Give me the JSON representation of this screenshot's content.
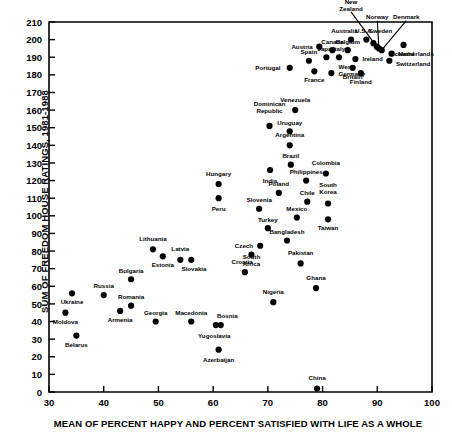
{
  "chart_data": {
    "type": "scatter",
    "title": "",
    "xlabel": "MEAN OF PERCENT HAPPY AND PERCENT SATISFIED WITH LIFE AS A WHOLE",
    "ylabel": "SUM OF FREEDOM HOUSE RATINGS, 1981-1988",
    "xlim": [
      30,
      100
    ],
    "ylim": [
      0,
      210
    ],
    "xticks": [
      30,
      40,
      50,
      60,
      70,
      80,
      90,
      100
    ],
    "yticks": [
      0,
      10,
      20,
      30,
      40,
      50,
      60,
      70,
      80,
      90,
      100,
      110,
      120,
      130,
      140,
      150,
      160,
      170,
      180,
      190,
      200,
      210
    ],
    "grid": false,
    "legend": null,
    "marker": "filled-circle",
    "points": [
      {
        "label": "Moldova",
        "x": 33.0,
        "y": 45,
        "lx": 33.0,
        "ly": 40,
        "anchor": "middle",
        "lead": false
      },
      {
        "label": "Ukraine",
        "x": 34.2,
        "y": 56,
        "lx": 34.2,
        "ly": 51,
        "anchor": "middle",
        "lead": false
      },
      {
        "label": "Belarus",
        "x": 35.0,
        "y": 32,
        "lx": 35.0,
        "ly": 27,
        "anchor": "middle",
        "lead": false
      },
      {
        "label": "Russia",
        "x": 40.0,
        "y": 55,
        "lx": 40.0,
        "ly": 60,
        "anchor": "middle",
        "lead": false
      },
      {
        "label": "Armenia",
        "x": 43.0,
        "y": 46,
        "lx": 43.0,
        "ly": 41,
        "anchor": "middle",
        "lead": false
      },
      {
        "label": "Bulgaria",
        "x": 45.0,
        "y": 64,
        "lx": 45.0,
        "ly": 69,
        "anchor": "middle",
        "lead": false
      },
      {
        "label": "Romania",
        "x": 45.0,
        "y": 49,
        "lx": 45.0,
        "ly": 54,
        "anchor": "middle",
        "lead": false
      },
      {
        "label": "Lithuania",
        "x": 49.0,
        "y": 81,
        "lx": 49.0,
        "ly": 87,
        "anchor": "middle",
        "lead": false
      },
      {
        "label": "Georgia",
        "x": 49.5,
        "y": 40,
        "lx": 49.5,
        "ly": 45,
        "anchor": "middle",
        "lead": false
      },
      {
        "label": "Estonia",
        "x": 50.8,
        "y": 77,
        "lx": 50.8,
        "ly": 72,
        "anchor": "middle",
        "lead": false
      },
      {
        "label": "Latvia",
        "x": 54.0,
        "y": 75,
        "lx": 54.0,
        "ly": 81,
        "anchor": "middle",
        "lead": false
      },
      {
        "label": "Macedonia",
        "x": 56.0,
        "y": 40,
        "lx": 56.0,
        "ly": 45,
        "anchor": "middle",
        "lead": false
      },
      {
        "label": "Slovakia",
        "x": 56.0,
        "y": 75,
        "lx": 56.5,
        "ly": 70,
        "anchor": "middle",
        "lead": false
      },
      {
        "label": "Bosnia",
        "x": 61.4,
        "y": 38,
        "lx": 62.6,
        "ly": 43,
        "anchor": "middle",
        "lead": false
      },
      {
        "label": "Yugoslavia",
        "x": 60.5,
        "y": 38,
        "lx": 60.2,
        "ly": 32,
        "anchor": "middle",
        "lead": false
      },
      {
        "label": "Azerbaijan",
        "x": 61.0,
        "y": 24,
        "lx": 61.0,
        "ly": 18,
        "anchor": "middle",
        "lead": false
      },
      {
        "label": "Hungary",
        "x": 61.0,
        "y": 118,
        "lx": 61.0,
        "ly": 124,
        "anchor": "middle",
        "lead": false
      },
      {
        "label": "Peru",
        "x": 61.0,
        "y": 110,
        "lx": 61.0,
        "ly": 104,
        "anchor": "middle",
        "lead": false
      },
      {
        "label": "Croatia",
        "x": 65.8,
        "y": 68,
        "lx": 65.3,
        "ly": 74,
        "anchor": "middle",
        "lead": false
      },
      {
        "label": "South Africa",
        "x": 67.0,
        "y": 78,
        "lx": 67.0,
        "ly": 73,
        "anchor": "middle",
        "lead": false,
        "two": true
      },
      {
        "label": "Czech",
        "x": 68.6,
        "y": 83,
        "lx": 67.3,
        "ly": 83,
        "anchor": "end",
        "lead": false
      },
      {
        "label": "Slovenia",
        "x": 68.4,
        "y": 104,
        "lx": 68.4,
        "ly": 109,
        "anchor": "middle",
        "lead": false
      },
      {
        "label": "Turkey",
        "x": 70.0,
        "y": 93,
        "lx": 70.0,
        "ly": 98,
        "anchor": "middle",
        "lead": false
      },
      {
        "label": "Dominican Republic",
        "x": 70.3,
        "y": 151,
        "lx": 70.3,
        "ly": 160,
        "anchor": "middle",
        "lead": false,
        "two": true
      },
      {
        "label": "India",
        "x": 70.4,
        "y": 126,
        "lx": 70.4,
        "ly": 120,
        "anchor": "middle",
        "lead": false
      },
      {
        "label": "Nigeria",
        "x": 71.0,
        "y": 51,
        "lx": 71.0,
        "ly": 57,
        "anchor": "middle",
        "lead": false
      },
      {
        "label": "Poland",
        "x": 72.0,
        "y": 113,
        "lx": 72.0,
        "ly": 118,
        "anchor": "middle",
        "lead": false
      },
      {
        "label": "Uruguay",
        "x": 74.0,
        "y": 148,
        "lx": 74.0,
        "ly": 153,
        "anchor": "middle",
        "lead": false
      },
      {
        "label": "Argentina",
        "x": 74.0,
        "y": 140,
        "lx": 74.0,
        "ly": 146,
        "anchor": "middle",
        "lead": false
      },
      {
        "label": "Brazil",
        "x": 74.2,
        "y": 129,
        "lx": 74.2,
        "ly": 134,
        "anchor": "middle",
        "lead": false
      },
      {
        "label": "Bangladesh",
        "x": 73.5,
        "y": 86,
        "lx": 73.5,
        "ly": 91,
        "anchor": "middle",
        "lead": false
      },
      {
        "label": "Venezuela",
        "x": 75.0,
        "y": 160,
        "lx": 75.0,
        "ly": 166,
        "anchor": "middle",
        "lead": false
      },
      {
        "label": "Mexico",
        "x": 75.3,
        "y": 99,
        "lx": 75.3,
        "ly": 104,
        "anchor": "middle",
        "lead": false
      },
      {
        "label": "Pakistan",
        "x": 76.0,
        "y": 73,
        "lx": 76.0,
        "ly": 79,
        "anchor": "middle",
        "lead": false
      },
      {
        "label": "Philippines",
        "x": 77.0,
        "y": 120,
        "lx": 77.0,
        "ly": 125,
        "anchor": "middle",
        "lead": false
      },
      {
        "label": "Chile",
        "x": 77.2,
        "y": 108,
        "lx": 77.2,
        "ly": 113,
        "anchor": "middle",
        "lead": false
      },
      {
        "label": "Ghana",
        "x": 78.8,
        "y": 59,
        "lx": 78.8,
        "ly": 65,
        "anchor": "middle",
        "lead": false
      },
      {
        "label": "China",
        "x": 79.0,
        "y": 2,
        "lx": 79.0,
        "ly": 8,
        "anchor": "middle",
        "lead": false
      },
      {
        "label": "Colombia",
        "x": 80.6,
        "y": 124,
        "lx": 80.6,
        "ly": 130,
        "anchor": "middle",
        "lead": false
      },
      {
        "label": "South Korea",
        "x": 81.0,
        "y": 107,
        "lx": 81.0,
        "ly": 114,
        "anchor": "middle",
        "lead": false,
        "two": true
      },
      {
        "label": "Taiwan",
        "x": 81.0,
        "y": 98,
        "lx": 81.0,
        "ly": 93,
        "anchor": "middle",
        "lead": false
      },
      {
        "label": "Portugal",
        "x": 74.0,
        "y": 184,
        "lx": 72.3,
        "ly": 184,
        "anchor": "end",
        "lead": false
      },
      {
        "label": "Spain",
        "x": 77.5,
        "y": 188,
        "lx": 77.5,
        "ly": 193,
        "anchor": "middle",
        "lead": false
      },
      {
        "label": "France",
        "x": 78.5,
        "y": 182,
        "lx": 78.5,
        "ly": 177,
        "anchor": "middle",
        "lead": false
      },
      {
        "label": "Austria",
        "x": 79.4,
        "y": 196,
        "lx": 78.2,
        "ly": 196,
        "anchor": "end",
        "lead": false
      },
      {
        "label": "Japan",
        "x": 80.7,
        "y": 190,
        "lx": 80.7,
        "ly": 195,
        "anchor": "middle",
        "lead": false
      },
      {
        "label": "Canada",
        "x": 81.8,
        "y": 194,
        "lx": 81.8,
        "ly": 199,
        "anchor": "middle",
        "lead": false
      },
      {
        "label": "West Germany",
        "x": 81.6,
        "y": 181,
        "lx": 82.9,
        "ly": 181,
        "anchor": "start",
        "lead": false,
        "two": true
      },
      {
        "label": "Italy",
        "x": 83.0,
        "y": 190,
        "lx": 83.0,
        "ly": 195,
        "anchor": "middle",
        "lead": false
      },
      {
        "label": "Belgium",
        "x": 84.6,
        "y": 194,
        "lx": 84.6,
        "ly": 199,
        "anchor": "middle",
        "lead": false
      },
      {
        "label": "Australia",
        "x": 85.2,
        "y": 200,
        "lx": 84.0,
        "ly": 205,
        "anchor": "middle",
        "lead": false
      },
      {
        "label": "Britain",
        "x": 85.5,
        "y": 184,
        "lx": 85.5,
        "ly": 179,
        "anchor": "middle",
        "lead": false
      },
      {
        "label": "Ireland",
        "x": 86.0,
        "y": 189,
        "lx": 87.3,
        "ly": 189,
        "anchor": "start",
        "lead": false
      },
      {
        "label": "Finland",
        "x": 87.0,
        "y": 181,
        "lx": 87.0,
        "ly": 176,
        "anchor": "middle",
        "lead": false
      },
      {
        "label": "U.S.A.",
        "x": 88.0,
        "y": 200,
        "lx": 87.6,
        "ly": 205,
        "anchor": "middle",
        "lead": false
      },
      {
        "label": "Sweden",
        "x": 89.3,
        "y": 198,
        "lx": 90.6,
        "ly": 205,
        "anchor": "middle",
        "lead": false
      },
      {
        "label": "New Zealand",
        "x": 89.9,
        "y": 196,
        "lx": 85.2,
        "ly": 218,
        "anchor": "middle",
        "lead": true,
        "two": true
      },
      {
        "label": "Norway",
        "x": 90.3,
        "y": 195,
        "lx": 90.0,
        "ly": 213,
        "anchor": "middle",
        "lead": true
      },
      {
        "label": "Denmark",
        "x": 90.8,
        "y": 194,
        "lx": 95.3,
        "ly": 213,
        "anchor": "middle",
        "lead": true
      },
      {
        "label": "Iceland",
        "x": 94.8,
        "y": 197,
        "lx": 94.8,
        "ly": 192,
        "anchor": "middle",
        "lead": false
      },
      {
        "label": "Netherlands",
        "x": 92.6,
        "y": 192,
        "lx": 93.8,
        "ly": 192,
        "anchor": "start",
        "lead": false
      },
      {
        "label": "Switzerland",
        "x": 92.2,
        "y": 188,
        "lx": 93.4,
        "ly": 186,
        "anchor": "start",
        "lead": false
      }
    ]
  },
  "axis": {
    "ylabel_text": "SUM OF FREEDOM HOUSE RATINGS, 1981-1988",
    "xlabel_text": "MEAN OF PERCENT HAPPY AND PERCENT SATISFIED WITH LIFE AS A WHOLE"
  },
  "colors": {
    "marker": "#000000",
    "axis": "#000000",
    "background": "#ffffff"
  }
}
